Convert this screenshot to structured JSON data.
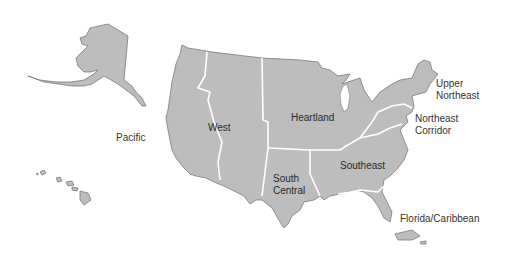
{
  "map": {
    "title": "US regions map",
    "colors": {
      "land": "#bdbdbd",
      "outline": "#7a7a7a",
      "region_border": "#ffffff",
      "label": "#333333"
    },
    "regions": [
      {
        "name": "West",
        "label": "West"
      },
      {
        "name": "Heartland",
        "label": "Heartland"
      },
      {
        "name": "South Central",
        "label_line1": "South",
        "label_line2": "Central"
      },
      {
        "name": "Southeast",
        "label": "Southeast"
      },
      {
        "name": "Northeast Corridor",
        "label_line1": "Northeast",
        "label_line2": "Corridor"
      },
      {
        "name": "Upper Northeast",
        "label_line1": "Upper",
        "label_line2": "Northeast"
      },
      {
        "name": "Florida/Caribbean",
        "label": "Florida/Caribbean"
      },
      {
        "name": "Pacific",
        "label": "Pacific"
      }
    ]
  }
}
